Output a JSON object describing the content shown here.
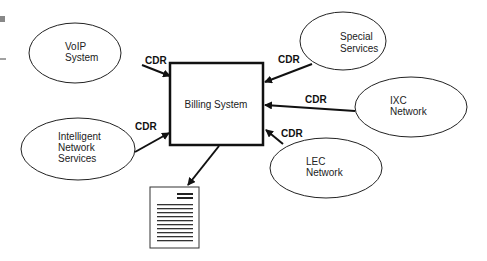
{
  "diagram": {
    "center": {
      "label": "Billing System"
    },
    "sources": [
      {
        "id": "voip",
        "lines": [
          "VoIP",
          "System"
        ]
      },
      {
        "id": "special",
        "lines": [
          "Special",
          "Services"
        ]
      },
      {
        "id": "ixc",
        "lines": [
          "IXC",
          "Network"
        ]
      },
      {
        "id": "lec",
        "lines": [
          "LEC",
          "Network"
        ]
      },
      {
        "id": "intelligent",
        "lines": [
          "Intelligent",
          "Network",
          "Services"
        ]
      }
    ],
    "edge_label": "CDR",
    "output": {
      "icon": "document-icon"
    }
  }
}
